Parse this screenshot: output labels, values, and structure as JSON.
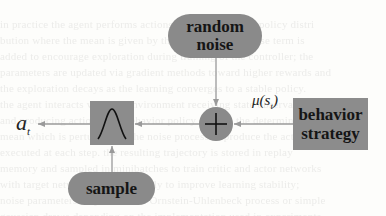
{
  "diagram": {
    "nodes": {
      "random_noise": {
        "line1": "random",
        "line2": "noise",
        "shape": "pill"
      },
      "sum": {
        "symbol": "+",
        "shape": "circle"
      },
      "behavior_strategy": {
        "line1": "behavior",
        "line2": "strategy",
        "shape": "rectangle"
      },
      "gaussian": {
        "icon": "bell-curve-icon",
        "shape": "rectangle"
      },
      "sample": {
        "label": "sample",
        "shape": "pill"
      }
    },
    "labels": {
      "output": {
        "base": "a",
        "sub": "t"
      },
      "mean": {
        "prefix": "μ(s",
        "sub": "t",
        "suffix": ")"
      }
    },
    "edges": [
      {
        "from": "random noise",
        "to": "+"
      },
      {
        "from": "behavior strategy",
        "to": "+",
        "label": "μ(s_t)"
      },
      {
        "from": "+",
        "to": "gaussian"
      },
      {
        "from": "sample",
        "to": "gaussian"
      },
      {
        "from": "gaussian",
        "to": "a_t"
      }
    ],
    "colors": {
      "node_fill": "#8a8a8a",
      "arrow": "#9a9a9a",
      "text": "#151515"
    }
  }
}
